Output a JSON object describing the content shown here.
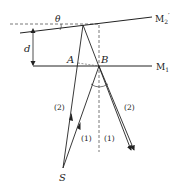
{
  "diagram": {
    "labels": {
      "theta": "θ",
      "d": "d",
      "mirror2": "M",
      "mirror2_sub": "2",
      "mirror2_prime": "′",
      "mirror1": "M",
      "mirror1_sub": "1",
      "point_a": "A",
      "point_b": "B",
      "source": "S",
      "ray2_left": "(2)",
      "ray2_right": "(2)",
      "ray1_left": "(1)",
      "ray1_right": "(1)"
    },
    "colors": {
      "line": "#222222",
      "dashed": "#555555"
    }
  }
}
